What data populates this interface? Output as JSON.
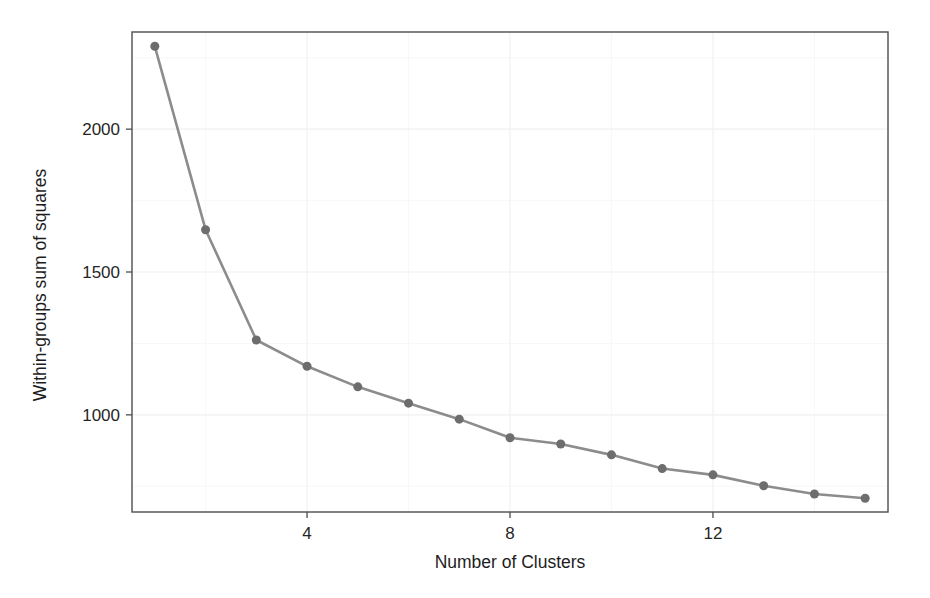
{
  "chart_data": {
    "type": "line",
    "title": "",
    "subtitle": "",
    "xlabel": "Number of Clusters",
    "ylabel": "Within-groups sum of squares",
    "x": [
      1,
      2,
      3,
      4,
      5,
      6,
      7,
      8,
      9,
      10,
      11,
      12,
      13,
      14,
      15
    ],
    "values": [
      2290,
      1648,
      1262,
      1170,
      1098,
      1041,
      985,
      920,
      898,
      860,
      812,
      790,
      752,
      723,
      708
    ],
    "series": [
      {
        "name": "Within-groups sum of squares",
        "values": [
          2290,
          1648,
          1262,
          1170,
          1098,
          1041,
          985,
          920,
          898,
          860,
          812,
          790,
          752,
          723,
          708
        ]
      }
    ],
    "xlim": [
      0.55,
      15.45
    ],
    "ylim": [
      660,
      2340
    ],
    "xticks": [
      4,
      8,
      12
    ],
    "xtick_labels": [
      "4",
      "8",
      "12"
    ],
    "yticks": [
      1000,
      1500,
      2000
    ],
    "ytick_labels": [
      "1000",
      "1500",
      "2000"
    ],
    "grid": true,
    "grid_major_y": [
      1000,
      1500,
      2000
    ],
    "grid_minor_y": [
      750,
      1250,
      1750,
      2250
    ],
    "grid_major_x": [
      4,
      8,
      12
    ],
    "grid_minor_x": [
      2,
      6,
      10,
      14
    ],
    "legend": "none",
    "legend_position": "none",
    "marker": "circle",
    "marker_size": 9,
    "line_color": "#8c8c8c",
    "point_color": "#6d6d6d",
    "panel_background": "#ffffff",
    "panel_border_color": "#4d4d4d",
    "annotations": []
  },
  "figure": {
    "background_color": "#ffffff",
    "axis_title_color": "#1d1d1d",
    "tick_label_color": "#262626"
  }
}
